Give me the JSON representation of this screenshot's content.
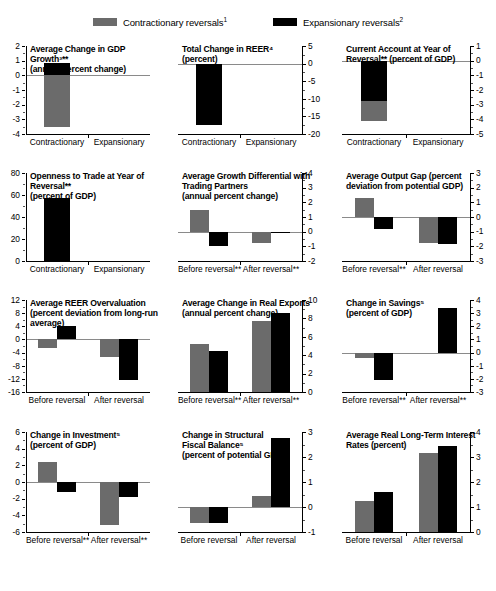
{
  "legend": {
    "items": [
      {
        "label": "Contractionary reversals",
        "sup": "1",
        "color": "#6b6b6b",
        "key": "contractionary"
      },
      {
        "label": "Expansionary reversals",
        "sup": "2",
        "color": "#000000",
        "key": "expansionary"
      }
    ]
  },
  "colors": {
    "contractionary": "#6b6b6b",
    "expansionary": "#000000",
    "axis": "#000000",
    "zeroline": "#8a8a8a"
  },
  "chart_data": [
    {
      "id": "gdp-growth",
      "type": "bar",
      "title": "Average Change in GDP Growth3** (annual percent change)",
      "title_lines": [
        "Average Change in GDP Growth³**",
        "(annual percent change)"
      ],
      "axis_side": "left",
      "categories": [
        "Contractionary",
        "Expansionary"
      ],
      "series": [
        {
          "name": "Contractionary reversals",
          "values": [
            -3.5
          ]
        },
        {
          "name": "Expansionary reversals",
          "values": [
            0.85
          ]
        }
      ],
      "values_flat": [
        -3.5,
        0.85
      ],
      "ylim": [
        -4,
        2
      ],
      "yticks": [
        2,
        1,
        0,
        -1,
        -2,
        -3,
        -4
      ],
      "ytick_labels": [
        "2",
        "1",
        "0",
        "-1",
        "-2",
        "-3",
        "-4"
      ],
      "grid": false,
      "legend_position": "top"
    },
    {
      "id": "total-change-reer",
      "type": "bar",
      "title": "Total Change in REER4 (percent)",
      "title_lines": [
        "Total Change in REER⁴",
        "(percent)"
      ],
      "axis_side": "right",
      "categories": [
        "Contractionary",
        "Expansionary"
      ],
      "series": [
        {
          "name": "Contractionary reversals",
          "values": [
            -6.5
          ]
        },
        {
          "name": "Expansionary reversals",
          "values": [
            -17.5
          ]
        }
      ],
      "values_flat": [
        -6.5,
        -17.5
      ],
      "ylim": [
        -20,
        5
      ],
      "yticks": [
        5,
        0,
        -5,
        -10,
        -15,
        -20
      ],
      "ytick_labels": [
        "5",
        "0",
        "-5",
        "-10",
        "-15",
        "-20"
      ],
      "grid": false
    },
    {
      "id": "current-account",
      "type": "bar",
      "title": "Current Account at Year of Reversal** (percent of GDP)",
      "title_lines": [
        "Current Account at Year of",
        "Reversal** (percent of GDP)"
      ],
      "axis_side": "right",
      "categories": [
        "Contractionary",
        "Expansionary"
      ],
      "series": [
        {
          "name": "Contractionary reversals",
          "values": [
            -4.1
          ]
        },
        {
          "name": "Expansionary reversals",
          "values": [
            -2.75
          ]
        }
      ],
      "values_flat": [
        -4.1,
        -2.75
      ],
      "ylim": [
        -5,
        1
      ],
      "yticks": [
        1,
        0,
        -1,
        -2,
        -3,
        -4,
        -5
      ],
      "ytick_labels": [
        "1",
        "0",
        "-1",
        "-2",
        "-3",
        "-4",
        "-5"
      ],
      "grid": false
    },
    {
      "id": "openness-to-trade",
      "type": "bar",
      "title": "Openness to Trade at Year of Reversal** (percent of GDP)",
      "title_lines": [
        "Openness to Trade at Year of",
        "Reversal**",
        "(percent of GDP)"
      ],
      "axis_side": "left",
      "categories": [
        "Contractionary",
        "Expansionary"
      ],
      "series": [
        {
          "name": "Contractionary reversals",
          "values": [
            46
          ]
        },
        {
          "name": "Expansionary reversals",
          "values": [
            57
          ]
        }
      ],
      "values_flat": [
        46,
        57
      ],
      "ylim": [
        0,
        80
      ],
      "yticks": [
        80,
        60,
        40,
        20,
        0
      ],
      "ytick_labels": [
        "80",
        "60",
        "40",
        "20",
        "0"
      ],
      "grid": false
    },
    {
      "id": "growth-differential",
      "type": "bar",
      "title": "Average Growth Differential with Trading Partners (annual percent change)",
      "title_lines": [
        "Average Growth Differential with",
        "Trading Partners",
        "(annual percent change)"
      ],
      "axis_side": "right",
      "categories": [
        "Before reversal**",
        "After reversal**"
      ],
      "series": [
        {
          "name": "Contractionary reversals",
          "values": [
            1.5,
            -0.75
          ]
        },
        {
          "name": "Expansionary reversals",
          "values": [
            -1.0,
            -0.1
          ]
        }
      ],
      "ylim": [
        -2,
        4
      ],
      "yticks": [
        4,
        3,
        2,
        1,
        0,
        -1,
        -2
      ],
      "ytick_labels": [
        "4",
        "3",
        "2",
        "1",
        "0",
        "-1",
        "-2"
      ],
      "grid": false
    },
    {
      "id": "output-gap",
      "type": "bar",
      "title": "Average Output Gap (percent deviation from potential GDP)",
      "title_lines": [
        "Average Output Gap (percent",
        "deviation from potential GDP)"
      ],
      "axis_side": "right",
      "categories": [
        "Before reversal**",
        "After reversal"
      ],
      "series": [
        {
          "name": "Contractionary reversals",
          "values": [
            1.3,
            -1.75
          ]
        },
        {
          "name": "Expansionary reversals",
          "values": [
            -0.85,
            -1.85
          ]
        }
      ],
      "ylim": [
        -3,
        3
      ],
      "yticks": [
        3,
        2,
        1,
        0,
        -1,
        -2,
        -3
      ],
      "ytick_labels": [
        "3",
        "2",
        "1",
        "0",
        "-1",
        "-2",
        "-3"
      ],
      "grid": false
    },
    {
      "id": "reer-overvaluation",
      "type": "bar",
      "title": "Average REER Overvaluation (percent deviation from long-run average)",
      "title_lines": [
        "Average REER Overvaluation",
        "(percent deviation from long-run",
        "average)"
      ],
      "axis_side": "left",
      "categories": [
        "Before reversal",
        "After reversal"
      ],
      "series": [
        {
          "name": "Contractionary reversals",
          "values": [
            -2.6,
            -5.3
          ]
        },
        {
          "name": "Expansionary reversals",
          "values": [
            4.0,
            -12.5
          ]
        }
      ],
      "ylim": [
        -16,
        12
      ],
      "yticks": [
        12,
        8,
        4,
        0,
        -4,
        -8,
        -12,
        -16
      ],
      "ytick_labels": [
        "12",
        "8",
        "4",
        "0",
        "-4",
        "-8",
        "-12",
        "-16"
      ],
      "grid": false
    },
    {
      "id": "real-exports",
      "type": "bar",
      "title": "Average Change in Real Exports (annual percent change)",
      "title_lines": [
        "Average Change in Real Exports",
        "(annual percent change)"
      ],
      "axis_side": "right",
      "categories": [
        "Before reversal**",
        "After reversal**"
      ],
      "series": [
        {
          "name": "Contractionary reversals",
          "values": [
            5.2,
            7.7
          ]
        },
        {
          "name": "Expansionary reversals",
          "values": [
            4.5,
            8.6
          ]
        }
      ],
      "ylim": [
        0,
        10
      ],
      "yticks": [
        10,
        8,
        6,
        4,
        2,
        0
      ],
      "ytick_labels": [
        "10",
        "8",
        "6",
        "4",
        "2",
        "0"
      ],
      "grid": false
    },
    {
      "id": "change-in-savings",
      "type": "bar",
      "title": "Change in Savings5 (percent of GDP)",
      "title_lines": [
        "Change in Savings⁵",
        "(percent of GDP)"
      ],
      "axis_side": "right",
      "categories": [
        "Before reversal**",
        "After reversal**"
      ],
      "series": [
        {
          "name": "Contractionary reversals",
          "values": [
            -0.45,
            0.0
          ]
        },
        {
          "name": "Expansionary reversals",
          "values": [
            -2.1,
            3.4
          ]
        }
      ],
      "ylim": [
        -3,
        4
      ],
      "yticks": [
        4,
        3,
        2,
        1,
        0,
        -1,
        -2,
        -3
      ],
      "ytick_labels": [
        "4",
        "3",
        "2",
        "1",
        "0",
        "-1",
        "-2",
        "-3"
      ],
      "grid": false
    },
    {
      "id": "change-in-investment",
      "type": "bar",
      "title": "Change in Investment5 (percent of GDP)",
      "title_lines": [
        "Change in Investment⁵",
        "(percent of GDP)"
      ],
      "axis_side": "left",
      "categories": [
        "Before reversal**",
        "After reversal**"
      ],
      "series": [
        {
          "name": "Contractionary reversals",
          "values": [
            2.4,
            -5.2
          ]
        },
        {
          "name": "Expansionary reversals",
          "values": [
            -1.2,
            -1.8
          ]
        }
      ],
      "ylim": [
        -6,
        6
      ],
      "yticks": [
        6,
        4,
        2,
        0,
        -2,
        -4,
        -6
      ],
      "ytick_labels": [
        "6",
        "4",
        "2",
        "0",
        "-2",
        "-4",
        "-6"
      ],
      "grid": false
    },
    {
      "id": "structural-fiscal-balance",
      "type": "bar",
      "title": "Change in Structural Fiscal Balance5 (percent of potential GDP)",
      "title_lines": [
        "Change in Structural",
        "Fiscal Balance⁵",
        "(percent of potential GDP)"
      ],
      "axis_side": "right",
      "categories": [
        "Before reversal",
        "After reversal"
      ],
      "series": [
        {
          "name": "Contractionary reversals",
          "values": [
            -0.65,
            0.45
          ]
        },
        {
          "name": "Expansionary reversals",
          "values": [
            -0.65,
            2.75
          ]
        }
      ],
      "ylim": [
        -1,
        3
      ],
      "yticks": [
        3,
        2,
        1,
        0,
        -1
      ],
      "ytick_labels": [
        "3",
        "2",
        "1",
        "0",
        "-1"
      ],
      "grid": false
    },
    {
      "id": "real-long-term-interest-rates",
      "type": "bar",
      "title": "Average Real Long-Term Interest Rates (percent)",
      "title_lines": [
        "Average Real Long-Term Interest",
        "Rates (percent)"
      ],
      "axis_side": "right",
      "categories": [
        "Before reversal",
        "After reversal"
      ],
      "series": [
        {
          "name": "Contractionary reversals",
          "values": [
            1.25,
            3.15
          ]
        },
        {
          "name": "Expansionary reversals",
          "values": [
            1.6,
            3.45
          ]
        }
      ],
      "ylim": [
        0,
        4
      ],
      "yticks": [
        4,
        3,
        2,
        1,
        0
      ],
      "ytick_labels": [
        "4",
        "3",
        "2",
        "1",
        "0"
      ],
      "grid": false
    }
  ]
}
